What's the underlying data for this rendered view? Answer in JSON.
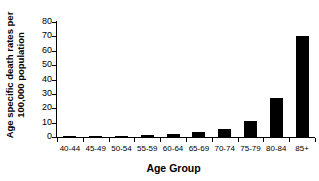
{
  "chart_data": {
    "type": "bar",
    "title": "",
    "xlabel": "Age Group",
    "ylabel_line1": "Age specific death rates per",
    "ylabel_line2": "100,000 population",
    "ylabel": "Age specific death rates per 100,000 population",
    "categories": [
      "40-44",
      "45-49",
      "50-54",
      "55-59",
      "60-64",
      "65-69",
      "70-74",
      "75-79",
      "80-84",
      "85+"
    ],
    "values": [
      0.3,
      0.4,
      0.8,
      1.2,
      2.0,
      3.5,
      5.5,
      11.0,
      27.0,
      70.0
    ],
    "ylim": [
      0,
      80
    ],
    "ytick_labels": [
      "0",
      "10",
      "20",
      "30",
      "40",
      "50",
      "60",
      "70",
      "80"
    ],
    "ytick_values": [
      0,
      10,
      20,
      30,
      40,
      50,
      60,
      70,
      80
    ],
    "bar_color": "#000000",
    "axis_color": "#000000",
    "background": "#ffffff",
    "grid": false,
    "legend": false
  }
}
